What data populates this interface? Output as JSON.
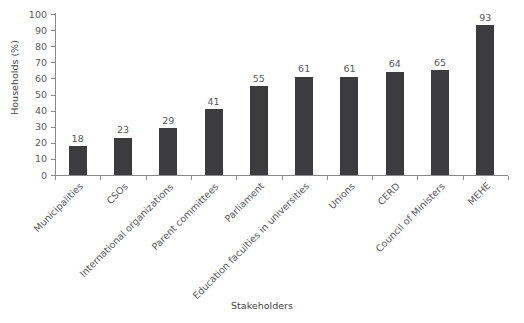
{
  "figure": {
    "title_remnant": "",
    "background_color": "#ffffff",
    "bar_color": "#3c3c3e",
    "axis_color": "#8a8a8c",
    "text_color": "#58585a"
  },
  "chart_data": {
    "type": "bar",
    "title": "",
    "xlabel": "Stakeholders",
    "ylabel": "Households (%)",
    "ylim": [
      0,
      100
    ],
    "ytick_step": 10,
    "yticks": [
      0,
      10,
      20,
      30,
      40,
      50,
      60,
      70,
      80,
      90,
      100
    ],
    "ytick_labels": [
      "0",
      "10",
      "20",
      "30",
      "40",
      "50",
      "60",
      "70",
      "80",
      "90",
      "100"
    ],
    "grid": false,
    "legend": false,
    "orientation": "vertical",
    "xtick_label_rotation": -45,
    "show_value_labels": true,
    "categories": [
      "Municipalities",
      "CSOs",
      "International organizations",
      "Parent committees",
      "Parliament",
      "Education faculties in universities",
      "Unions",
      "CERD",
      "Council of Ministers",
      "MEHE"
    ],
    "values": [
      18,
      23,
      29,
      41,
      55,
      61,
      61,
      64,
      65,
      93
    ],
    "value_labels": [
      "18",
      "23",
      "29",
      "41",
      "55",
      "61",
      "61",
      "64",
      "65",
      "93"
    ]
  }
}
